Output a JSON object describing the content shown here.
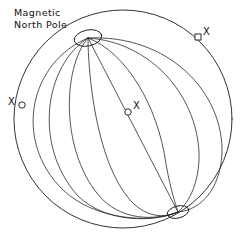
{
  "figure": {
    "title": "Magnetic North Pole",
    "caption_lines": "Magnetic\nNorth Pole",
    "background_color": "#ffffff",
    "line_color": "#1b1b1b",
    "width": 246,
    "height": 240
  },
  "sphere": {
    "label": "globe outline",
    "center_x": 123,
    "center_y": 119,
    "radius": 109
  },
  "poles": {
    "north": {
      "label": "Magnetic North Pole",
      "x": 88,
      "y": 38
    },
    "south": {
      "label": "south magnetic pole",
      "x": 178,
      "y": 212
    }
  },
  "axis": {
    "label": "magnetic axis"
  },
  "markers": [
    {
      "id": "left",
      "label": "X",
      "shape": "circle",
      "x": 22,
      "y": 105
    },
    {
      "id": "center",
      "label": "X",
      "shape": "circle",
      "x": 128,
      "y": 112
    },
    {
      "id": "right",
      "label": "X",
      "shape": "square",
      "x": 198,
      "y": 37
    }
  ],
  "meridians": {
    "count": 7,
    "label": "magnetic meridian field lines"
  }
}
